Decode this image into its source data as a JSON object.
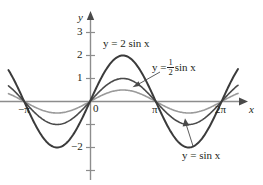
{
  "chart_data": {
    "type": "line",
    "title": "",
    "xlabel": "x",
    "ylabel": "y",
    "xlim": [
      -3.6,
      7.3
    ],
    "ylim": [
      -3.5,
      3.6
    ],
    "grid": false,
    "legend_position": "inline-annotations",
    "x_tick_labels": [
      "−π",
      "0",
      "π",
      "2π"
    ],
    "x_tick_values": [
      -3.14159,
      0,
      3.14159,
      6.28319
    ],
    "y_tick_labels": [
      "3",
      "2",
      "1",
      "−2"
    ],
    "y_tick_values": [
      3,
      2,
      1,
      -2
    ],
    "y_tick_marks_all": [
      3,
      2,
      1,
      -1,
      -2,
      -3
    ],
    "series": [
      {
        "name": "y = 2 sin x",
        "amplitude": 2,
        "color": "#3b3b3b",
        "linewidth": 2.0,
        "label_text": "y = 2 sin x",
        "peak": {
          "x": 1.5708,
          "y": 2
        },
        "trough": {
          "x": 4.7124,
          "y": -2
        }
      },
      {
        "name": "y = sin x",
        "amplitude": 1,
        "color": "#4a4a4a",
        "linewidth": 1.6,
        "label_text": "y = sin x",
        "peak": {
          "x": 1.5708,
          "y": 1
        },
        "trough": {
          "x": 4.7124,
          "y": -1
        }
      },
      {
        "name": "y = 1/2 sin x",
        "amplitude": 0.5,
        "color": "#9a9a9a",
        "linewidth": 1.6,
        "label_text_prefix": "y =",
        "label_numerator": "1",
        "label_denominator": "2",
        "label_text_suffix": "sin x",
        "peak": {
          "x": 1.5708,
          "y": 0.5
        },
        "trough": {
          "x": 4.7124,
          "y": -0.5
        }
      }
    ]
  },
  "axes": {
    "y_axis_name": "y",
    "x_axis_name": "x",
    "origin_label": "0",
    "axis_color": "#8d8d8d",
    "tick_labels_y": [
      "3",
      "2",
      "1",
      "−2"
    ],
    "tick_labels_x": [
      "−π",
      "π",
      "2π"
    ]
  },
  "annotations": {
    "label_2sin": "y = 2 sin x",
    "label_half_sin_prefix": "y =",
    "label_half_sin_num": "1",
    "label_half_sin_den": "2",
    "label_half_sin_suffix": "sin x",
    "label_sin": "y = sin x"
  }
}
